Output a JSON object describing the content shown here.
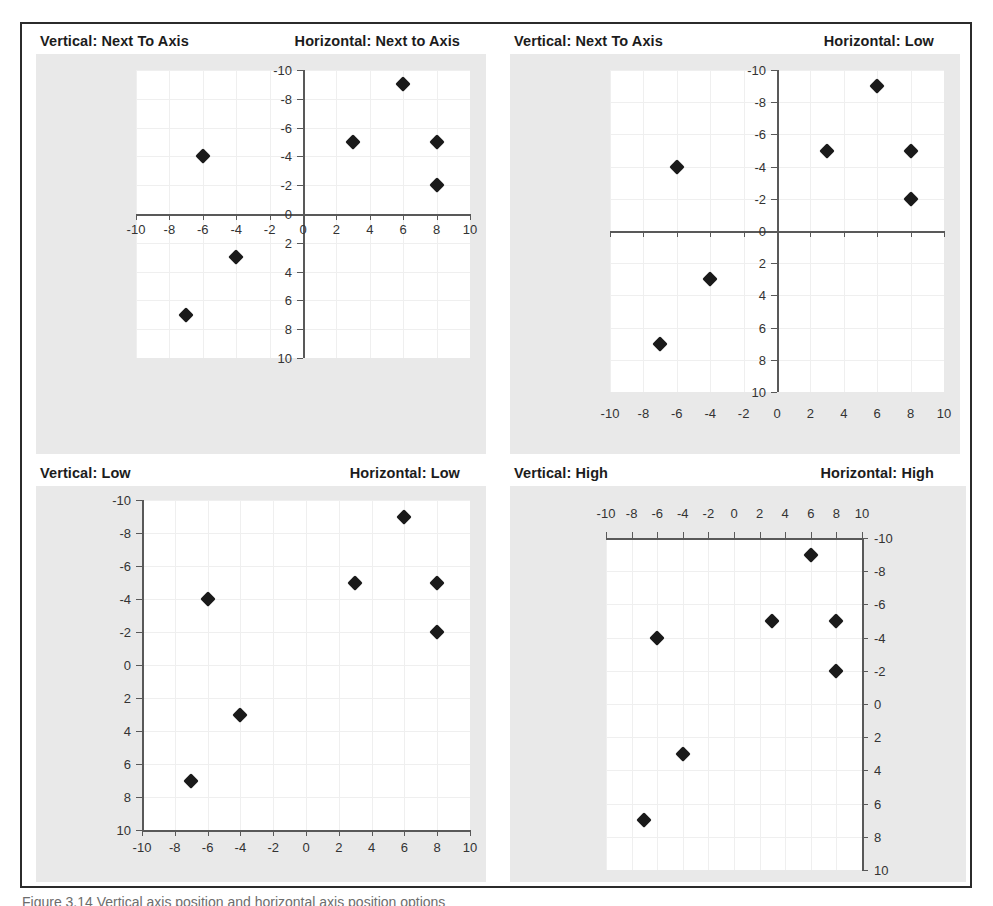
{
  "figure": {
    "caption": "Figure 3.14   Vertical axis position and horizontal axis position options",
    "panel_count": 4
  },
  "axis_labels": {
    "x_ticks": [
      "-10",
      "-8",
      "-6",
      "-4",
      "-2",
      "0",
      "2",
      "4",
      "6",
      "8",
      "10"
    ],
    "y_ticks": [
      "10",
      "8",
      "6",
      "4",
      "2",
      "0",
      "-2",
      "-4",
      "-6",
      "-8",
      "-10"
    ]
  },
  "chart_data": [
    {
      "type": "scatter",
      "id": "top-left",
      "title_vertical": "Vertical: Next To Axis",
      "title_horizontal": "Horizontal: Next to Axis",
      "vertical_axis_position": "Next To Axis",
      "horizontal_axis_position": "Next to Axis",
      "xlabel": "",
      "ylabel": "",
      "xlim": [
        -10,
        10
      ],
      "ylim": [
        -10,
        10
      ],
      "xticks": [
        -10,
        -8,
        -6,
        -4,
        -2,
        0,
        2,
        4,
        6,
        8,
        10
      ],
      "yticks": [
        -10,
        -8,
        -6,
        -4,
        -2,
        0,
        2,
        4,
        6,
        8,
        10
      ],
      "grid": true,
      "legend": "none",
      "marker": "diamond",
      "marker_color": "#1a1a1a",
      "points": [
        {
          "x": -7,
          "y": -7
        },
        {
          "x": -6,
          "y": 4
        },
        {
          "x": -4,
          "y": -3
        },
        {
          "x": 3,
          "y": 5
        },
        {
          "x": 6,
          "y": 9
        },
        {
          "x": 8,
          "y": 5
        },
        {
          "x": 8,
          "y": 2
        }
      ]
    },
    {
      "type": "scatter",
      "id": "top-right",
      "title_vertical": "Vertical: Next To Axis",
      "title_horizontal": "Horizontal: Low",
      "vertical_axis_position": "Next To Axis",
      "horizontal_axis_position": "Low",
      "xlabel": "",
      "ylabel": "",
      "xlim": [
        -10,
        10
      ],
      "ylim": [
        -10,
        10
      ],
      "xticks": [
        -10,
        -8,
        -6,
        -4,
        -2,
        0,
        2,
        4,
        6,
        8,
        10
      ],
      "yticks": [
        -10,
        -8,
        -6,
        -4,
        -2,
        0,
        2,
        4,
        6,
        8,
        10
      ],
      "grid": true,
      "legend": "none",
      "marker": "diamond",
      "marker_color": "#1a1a1a",
      "points": [
        {
          "x": -7,
          "y": -7
        },
        {
          "x": -6,
          "y": 4
        },
        {
          "x": -4,
          "y": -3
        },
        {
          "x": 3,
          "y": 5
        },
        {
          "x": 6,
          "y": 9
        },
        {
          "x": 8,
          "y": 5
        },
        {
          "x": 8,
          "y": 2
        }
      ]
    },
    {
      "type": "scatter",
      "id": "bottom-left",
      "title_vertical": "Vertical: Low",
      "title_horizontal": "Horizontal: Low",
      "vertical_axis_position": "Low",
      "horizontal_axis_position": "Low",
      "xlabel": "",
      "ylabel": "",
      "xlim": [
        -10,
        10
      ],
      "ylim": [
        -10,
        10
      ],
      "xticks": [
        -10,
        -8,
        -6,
        -4,
        -2,
        0,
        2,
        4,
        6,
        8,
        10
      ],
      "yticks": [
        -10,
        -8,
        -6,
        -4,
        -2,
        0,
        2,
        4,
        6,
        8,
        10
      ],
      "grid": true,
      "legend": "none",
      "marker": "diamond",
      "marker_color": "#1a1a1a",
      "points": [
        {
          "x": -7,
          "y": -7
        },
        {
          "x": -6,
          "y": 4
        },
        {
          "x": -4,
          "y": -3
        },
        {
          "x": 3,
          "y": 5
        },
        {
          "x": 6,
          "y": 9
        },
        {
          "x": 8,
          "y": 5
        },
        {
          "x": 8,
          "y": 2
        }
      ]
    },
    {
      "type": "scatter",
      "id": "bottom-right",
      "title_vertical": "Vertical: High",
      "title_horizontal": "Horizontal: High",
      "vertical_axis_position": "High",
      "horizontal_axis_position": "High",
      "xlabel": "",
      "ylabel": "",
      "xlim": [
        -10,
        10
      ],
      "ylim": [
        -10,
        10
      ],
      "xticks": [
        -10,
        -8,
        -6,
        -4,
        -2,
        0,
        2,
        4,
        6,
        8,
        10
      ],
      "yticks": [
        -10,
        -8,
        -6,
        -4,
        -2,
        0,
        2,
        4,
        6,
        8,
        10
      ],
      "grid": true,
      "legend": "none",
      "marker": "diamond",
      "marker_color": "#1a1a1a",
      "points": [
        {
          "x": -7,
          "y": -7
        },
        {
          "x": -6,
          "y": 4
        },
        {
          "x": -4,
          "y": -3
        },
        {
          "x": 3,
          "y": 5
        },
        {
          "x": 6,
          "y": 9
        },
        {
          "x": 8,
          "y": 5
        },
        {
          "x": 8,
          "y": 2
        }
      ]
    }
  ]
}
